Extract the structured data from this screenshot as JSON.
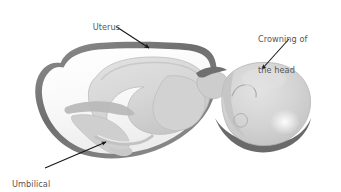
{
  "figure": {
    "type": "anatomical-illustration",
    "background_color": "#ffffff"
  },
  "labels": {
    "uterus": "Uterus",
    "crowning_line1": "Crowning of",
    "crowning_line2": "the head",
    "umbilical_line1": "Umbilical",
    "umbilical_line2": "cord"
  },
  "colors": {
    "text": "#565656",
    "arrow": "#1a1a1a",
    "uterus_wall": "#7c7c7c",
    "uterus_wall_dark": "#5f5f5f",
    "uterus_cavity": "#f4f4f4",
    "fetus_body": "#d7d7d7",
    "fetus_shadow": "#bdbdbd",
    "fetus_highlight": "#ededed",
    "head_fill": "#d2d2d2",
    "outline": "#9a9a9a"
  },
  "annotations": [
    {
      "name": "uterus",
      "label": "Uterus",
      "arrow_from": [
        116,
        27
      ],
      "arrow_to": [
        148,
        48
      ],
      "points_at": "uterine wall upper edge"
    },
    {
      "name": "crowning-of-the-head",
      "label": "Crowning of the head",
      "arrow_from": [
        288,
        39
      ],
      "arrow_to": [
        262,
        68
      ],
      "points_at": "emerging fetal head"
    },
    {
      "name": "umbilical-cord",
      "label": "Umbilical cord",
      "arrow_from": [
        45,
        168
      ],
      "arrow_to": [
        105,
        143
      ],
      "points_at": "umbilical cord inside uterus"
    }
  ]
}
